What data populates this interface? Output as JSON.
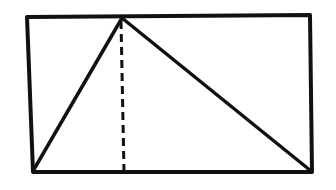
{
  "diagram": {
    "stroke_color": "#111111",
    "background": "#ffffff",
    "rectangle": {
      "points": [
        [
          27,
          17
        ],
        [
          310,
          15
        ],
        [
          312,
          172
        ],
        [
          33,
          172
        ]
      ]
    },
    "triangle": {
      "apex": [
        122,
        18
      ],
      "base_left": [
        33,
        171
      ],
      "base_right": [
        311,
        171
      ]
    },
    "altitude": {
      "from": [
        121,
        21
      ],
      "to": [
        124,
        172
      ],
      "style": "dashed"
    }
  }
}
